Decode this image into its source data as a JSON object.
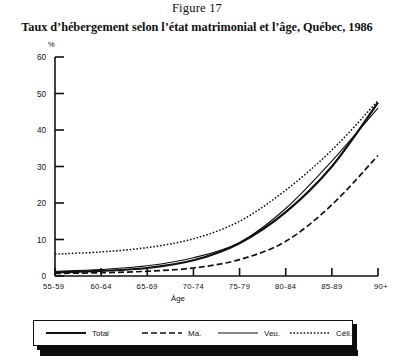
{
  "figure": {
    "number_label": "Figure 17",
    "title": "Taux d’hébergement selon l’état matrimonial et l’âge, Québec, 1986",
    "percent_symbol": "%"
  },
  "legend": {
    "items": [
      {
        "label": "Total",
        "style": "thick-solid"
      },
      {
        "label": "Ma.",
        "style": "dashed"
      },
      {
        "label": "Veu.",
        "style": "thin-solid"
      },
      {
        "label": "Céli.",
        "style": "dotted"
      }
    ]
  },
  "axes": {
    "y_ticks": [
      "0",
      "10",
      "20",
      "30",
      "40",
      "50",
      "60"
    ],
    "x_ticks": [
      "55-59",
      "60-64",
      "65-69",
      "70-74",
      "75-79",
      "80-84",
      "85-89",
      "90+"
    ],
    "x_axis_title": "Âge",
    "y_axis_title": "%"
  },
  "chart_data": {
    "type": "line",
    "title": "Taux d’hébergement selon l’état matrimonial et l’âge, Québec, 1986",
    "subtitle": "Figure 17",
    "xlabel": "Âge",
    "ylabel": "%",
    "categories": [
      "55-59",
      "60-64",
      "65-69",
      "70-74",
      "75-79",
      "80-84",
      "85-89",
      "90+"
    ],
    "ylim": [
      0,
      60
    ],
    "yticks": [
      0,
      10,
      20,
      30,
      40,
      50,
      60
    ],
    "grid": false,
    "legend_position": "bottom",
    "series": [
      {
        "name": "Total",
        "style": "thick-solid",
        "values": [
          1.0,
          1.4,
          2.2,
          4.3,
          9.0,
          17.5,
          30.0,
          47.5
        ]
      },
      {
        "name": "Ma.",
        "style": "dashed",
        "values": [
          0.7,
          0.9,
          1.3,
          2.2,
          4.5,
          9.5,
          19.5,
          33.0
        ]
      },
      {
        "name": "Veu.",
        "style": "thin-solid",
        "values": [
          1.3,
          1.8,
          2.8,
          5.0,
          9.2,
          18.5,
          31.5,
          46.0
        ]
      },
      {
        "name": "Céli.",
        "style": "dotted",
        "values": [
          6.0,
          6.6,
          7.8,
          10.2,
          15.0,
          23.5,
          34.5,
          48.0
        ]
      }
    ]
  }
}
